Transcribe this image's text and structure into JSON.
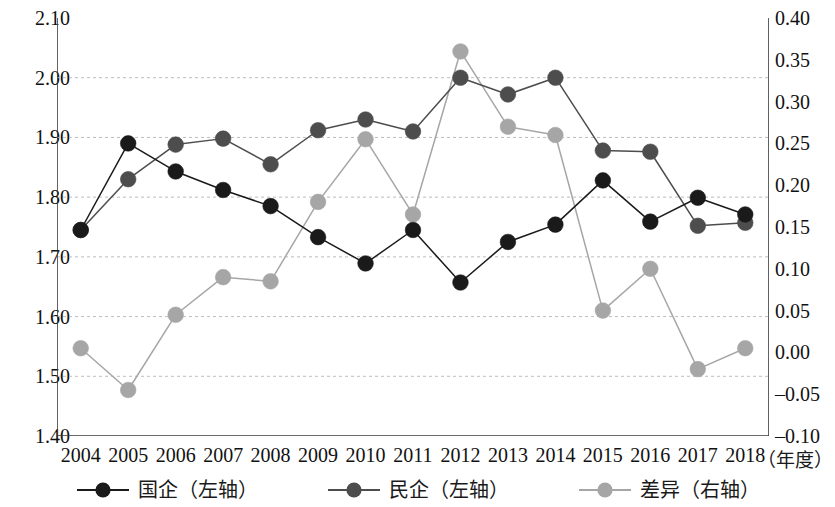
{
  "chart_data": {
    "type": "line",
    "title": "",
    "xlabel": "（年度）",
    "ylabel": "",
    "grid": true,
    "legend_position": "bottom",
    "categories": [
      "2004",
      "2005",
      "2006",
      "2007",
      "2008",
      "2009",
      "2010",
      "2011",
      "2012",
      "2013",
      "2014",
      "2015",
      "2016",
      "2017",
      "2018"
    ],
    "x_tick_labels": [
      "2004",
      "2005",
      "2006",
      "2007",
      "2008",
      "2009",
      "2010",
      "2011",
      "2012",
      "2013",
      "2014",
      "2015",
      "2016",
      "2017",
      "2018"
    ],
    "axes": {
      "left": {
        "min": 1.4,
        "max": 2.1,
        "step": 0.1,
        "ticks": [
          "1.40",
          "1.50",
          "1.60",
          "1.70",
          "1.80",
          "1.90",
          "2.00",
          "2.10"
        ],
        "tick_values": [
          1.4,
          1.5,
          1.6,
          1.7,
          1.8,
          1.9,
          2.0,
          2.1
        ]
      },
      "right": {
        "min": -0.1,
        "max": 0.4,
        "step": 0.05,
        "ticks": [
          "-0.10",
          "-0.05",
          "0.00",
          "0.05",
          "0.10",
          "0.15",
          "0.20",
          "0.25",
          "0.30",
          "0.35",
          "0.40"
        ],
        "tick_values": [
          -0.1,
          -0.05,
          0.0,
          0.05,
          0.1,
          0.15,
          0.2,
          0.25,
          0.3,
          0.35,
          0.4
        ]
      }
    },
    "series": [
      {
        "name": "国企（左轴）",
        "axis": "left",
        "color": "#1a1a1a",
        "marker": "circle",
        "values": [
          1.745,
          1.89,
          1.843,
          1.812,
          1.785,
          1.733,
          1.689,
          1.745,
          1.657,
          1.725,
          1.754,
          1.828,
          1.759,
          1.799,
          1.771
        ]
      },
      {
        "name": "民企（左轴）",
        "axis": "left",
        "color": "#4d4d4d",
        "marker": "circle",
        "values": [
          1.745,
          1.83,
          1.888,
          1.898,
          1.855,
          1.912,
          1.93,
          1.91,
          2.0,
          1.972,
          2.0,
          1.878,
          1.876,
          1.752,
          1.757
        ]
      },
      {
        "name": "差异（右轴）",
        "axis": "right",
        "color": "#a6a6a6",
        "marker": "circle",
        "values": [
          0.005,
          -0.045,
          0.045,
          0.09,
          0.085,
          0.18,
          0.255,
          0.165,
          0.36,
          0.27,
          0.26,
          0.05,
          0.1,
          -0.02,
          0.005
        ]
      }
    ]
  },
  "legend": {
    "items": [
      {
        "label": "国企（左轴）",
        "color": "#1a1a1a"
      },
      {
        "label": "民企（左轴）",
        "color": "#4d4d4d"
      },
      {
        "label": "差异（右轴）",
        "color": "#a6a6a6"
      }
    ]
  },
  "x_axis_title": "（年度）"
}
